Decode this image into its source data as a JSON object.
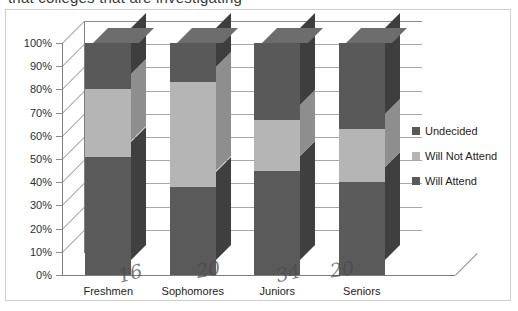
{
  "scan": {
    "clipped_top_line": "that colleges that are investigating",
    "pen_marks": [
      {
        "text": "16",
        "x": 118,
        "y": 262,
        "rotate": -14
      },
      {
        "text": "20",
        "x": 196,
        "y": 258,
        "rotate": -10
      },
      {
        "text": "34",
        "x": 276,
        "y": 262,
        "rotate": -12
      },
      {
        "text": "20",
        "x": 330,
        "y": 258,
        "rotate": -8
      }
    ]
  },
  "chart_data": {
    "type": "bar",
    "subtype": "stacked-column-3d",
    "title": "",
    "xlabel": "",
    "ylabel": "",
    "ylim": [
      0,
      100
    ],
    "grid": true,
    "legend_position": "right",
    "categories": [
      "Freshmen",
      "Sophomores",
      "Juniors",
      "Seniors"
    ],
    "tick_labels": [
      "0%",
      "10%",
      "20%",
      "30%",
      "40%",
      "50%",
      "60%",
      "70%",
      "80%",
      "90%",
      "100%"
    ],
    "tick_values": [
      0,
      10,
      20,
      30,
      40,
      50,
      60,
      70,
      80,
      90,
      100
    ],
    "series": [
      {
        "name": "Will Attend",
        "color": "#5a5a5a",
        "side_color": "#3f3f3f",
        "top_color": "#6e6e6e",
        "values": [
          51,
          38,
          45,
          40
        ]
      },
      {
        "name": "Will Not Attend",
        "color": "#b5b5b5",
        "side_color": "#8e8e8e",
        "top_color": "#c6c6c6",
        "values": [
          29,
          45,
          22,
          23
        ]
      },
      {
        "name": "Undecided",
        "color": "#595959",
        "side_color": "#3e3e3e",
        "top_color": "#6d6d6d",
        "values": [
          20,
          17,
          33,
          37
        ]
      }
    ],
    "legend_entries": [
      "Undecided",
      "Will Not Attend",
      "Will Attend"
    ]
  }
}
